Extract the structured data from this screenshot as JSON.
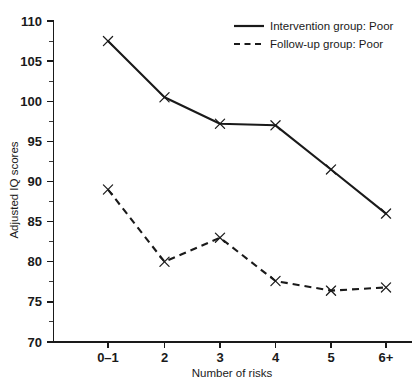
{
  "chart_data": {
    "type": "line",
    "title": "",
    "subtitle": "",
    "xlabel": "Number of risks",
    "ylabel": "Adjusted IQ scores",
    "categories": [
      "0–1",
      "2",
      "3",
      "4",
      "5",
      "6+"
    ],
    "ylim": [
      70,
      110
    ],
    "ytick_labels": [
      "70",
      "75",
      "80",
      "85",
      "90",
      "95",
      "100",
      "105",
      "110"
    ],
    "ytick_values": [
      70,
      75,
      80,
      85,
      90,
      95,
      100,
      105,
      110
    ],
    "ytick_minor_values": [
      72.5,
      77.5,
      82.5,
      87.5,
      92.5,
      97.5,
      102.5,
      107.5
    ],
    "grid": false,
    "legend_position": "top-right",
    "series": [
      {
        "name": "Intervention group: Poor",
        "style": "solid",
        "marker": "x",
        "color": "#1a1a1a",
        "values": [
          107.5,
          100.5,
          97.2,
          97.0,
          91.5,
          86.0
        ]
      },
      {
        "name": "Follow-up group: Poor",
        "style": "dashed",
        "marker": "x",
        "color": "#1a1a1a",
        "values": [
          89.0,
          80.0,
          83.0,
          77.6,
          76.4,
          76.8
        ]
      }
    ]
  },
  "legend": {
    "entries": [
      {
        "label": "Intervention group: Poor",
        "style": "solid"
      },
      {
        "label": "Follow-up group: Poor",
        "style": "dashed"
      }
    ]
  },
  "axes": {
    "y_title": "Adjusted IQ scores",
    "x_title": "Number of risks"
  }
}
